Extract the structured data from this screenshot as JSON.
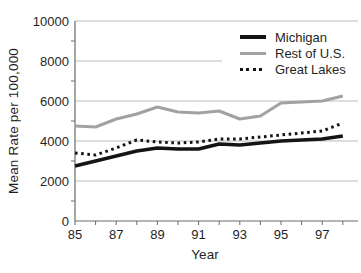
{
  "chart_data": {
    "type": "line",
    "title": "",
    "xlabel": "Year",
    "ylabel": "Mean Rate per 100,000",
    "x": [
      85,
      86,
      87,
      88,
      89,
      90,
      91,
      92,
      93,
      94,
      95,
      96,
      97,
      98
    ],
    "series": [
      {
        "name": "Michigan",
        "style": "solid",
        "color": "#141414",
        "stroke_width": 3.4,
        "values": [
          2750,
          3000,
          3250,
          3500,
          3650,
          3600,
          3600,
          3850,
          3800,
          3900,
          4000,
          4050,
          4100,
          4250
        ]
      },
      {
        "name": "Rest of U.S.",
        "style": "solid",
        "color": "#a2a2a2",
        "stroke_width": 3,
        "values": [
          4750,
          4700,
          5100,
          5350,
          5700,
          5450,
          5400,
          5500,
          5100,
          5250,
          5900,
          5950,
          6000,
          6250
        ]
      },
      {
        "name": "Great Lakes",
        "style": "dotted",
        "color": "#141414",
        "stroke_width": 3,
        "values": [
          3400,
          3300,
          3650,
          4050,
          3950,
          3900,
          3950,
          4100,
          4100,
          4200,
          4300,
          4400,
          4500,
          4900
        ]
      }
    ],
    "ylim": [
      0,
      10000
    ],
    "yticks": [
      0,
      2000,
      4000,
      6000,
      8000,
      10000
    ],
    "y_minor_ticks": [
      1000,
      3000,
      5000,
      7000,
      9000
    ],
    "xticks_labeled": [
      85,
      87,
      89,
      91,
      93,
      95,
      97
    ],
    "grid": "horizontal gridlines at major y ticks",
    "legend_position": "top-right",
    "colors": {
      "gridline": "#bdbdbd",
      "axis": "#6b6b6b",
      "text": "#1f1f1f"
    }
  }
}
